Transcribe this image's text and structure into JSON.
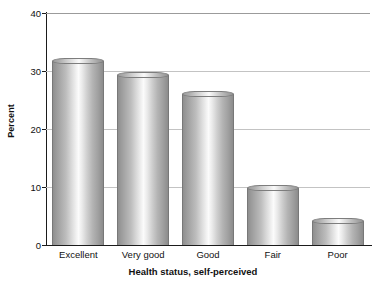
{
  "chart_data": {
    "type": "bar",
    "title": "",
    "subtitle": "",
    "xlabel": "Health status, self-perceived",
    "ylabel": "Percent",
    "categories": [
      "Excellent",
      "Very good",
      "Good",
      "Fair",
      "Poor"
    ],
    "values": [
      31.8,
      29.3,
      26.1,
      9.8,
      4.2
    ],
    "series": [
      {
        "name": "Percent",
        "values": [
          31.8,
          29.3,
          26.1,
          9.8,
          4.2
        ]
      }
    ],
    "ylim": [
      0,
      40
    ],
    "yticks": [
      0,
      10,
      20,
      30,
      40
    ],
    "ytick_labels": [
      "0",
      "10",
      "20",
      "30",
      "40"
    ],
    "grid": "horizontal",
    "legend": "none",
    "bar_style": "3d-cylinder-grayscale-gradient",
    "colors": {
      "bar_shadow": "#8f8f8f",
      "bar_highlight": "#fbfbfb",
      "bar_outline": "#787878",
      "gridline": "#c3c3c3",
      "axis": "#1b1b1b",
      "text": "#111111",
      "background": "#ffffff"
    }
  }
}
